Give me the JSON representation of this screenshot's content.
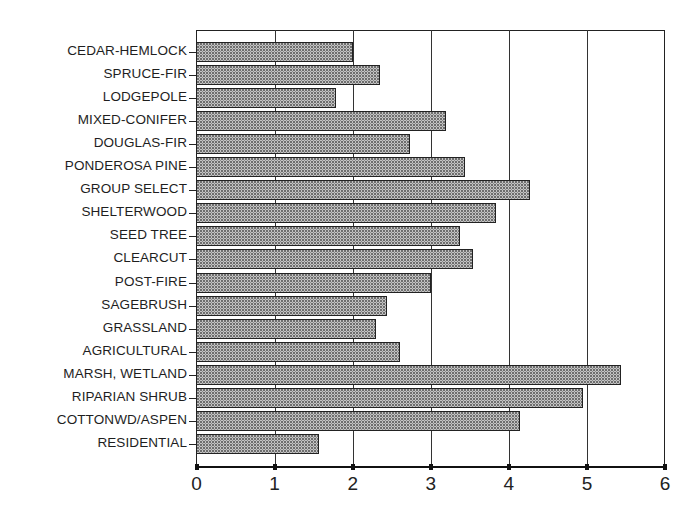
{
  "chart_data": {
    "type": "bar",
    "orientation": "horizontal",
    "title": "",
    "xlabel": "",
    "ylabel": "",
    "xlim": [
      0,
      6
    ],
    "xticks": [
      0,
      1,
      2,
      3,
      4,
      5,
      6
    ],
    "grid": {
      "x": true,
      "y": false
    },
    "legend": null,
    "categories": [
      "CEDAR-HEMLOCK",
      "SPRUCE-FIR",
      "LODGEPOLE",
      "MIXED-CONIFER",
      "DOUGLAS-FIR",
      "PONDEROSA PINE",
      "GROUP SELECT",
      "SHELTERWOOD",
      "SEED TREE",
      "CLEARCUT",
      "POST-FIRE",
      "SAGEBRUSH",
      "GRASSLAND",
      "AGRICULTURAL",
      "MARSH, WETLAND",
      "RIPARIAN SHRUB",
      "COTTONWD/ASPEN",
      "RESIDENTIAL"
    ],
    "values": [
      2.01,
      2.35,
      1.78,
      3.19,
      2.74,
      3.44,
      4.27,
      3.83,
      3.37,
      3.54,
      3.0,
      2.44,
      2.3,
      2.6,
      5.44,
      4.95,
      4.14,
      1.57
    ],
    "bar_fill": "#c4c4c4",
    "bar_pattern": "stippled-dots",
    "bar_border": "#222222"
  },
  "axis": {
    "x_tick_labels": [
      "0",
      "1",
      "2",
      "3",
      "4",
      "5",
      "6"
    ]
  }
}
